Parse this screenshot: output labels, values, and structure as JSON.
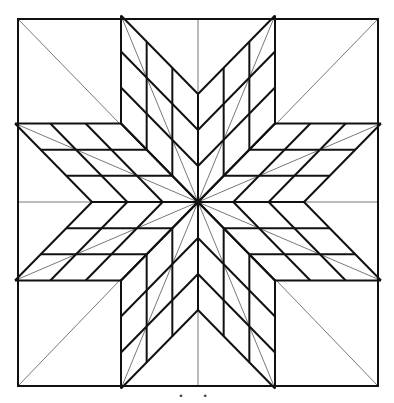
{
  "diagram": {
    "type": "line drawing",
    "frame": {
      "left": 18,
      "top": 19,
      "right": 378,
      "bottom": 386
    },
    "center": {
      "x": 198,
      "y": 202
    },
    "arms": 8,
    "subdivisions_per_arm": 3,
    "stroke_color": "#111111",
    "thin_stroke_color": "#555555",
    "background": "#ffffff"
  },
  "caption": "• •"
}
